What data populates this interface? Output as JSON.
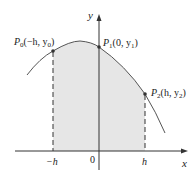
{
  "diagram": {
    "type": "simpsons-rule-parabola",
    "colors": {
      "curve": "#555555",
      "axis": "#333333",
      "shade": "#e6e6e6",
      "point": "#333333",
      "dash": "#333333"
    },
    "axes": {
      "x_label": "x",
      "y_label": "y",
      "origin_label": "0"
    },
    "ticks": {
      "left": "−h",
      "right": "h"
    },
    "points": [
      {
        "id": "P0",
        "name": "P",
        "sub": "0",
        "coords": "(−h, y",
        "coord_sub": "0",
        "close": ")"
      },
      {
        "id": "P1",
        "name": "P",
        "sub": "1",
        "coords": "(0, y",
        "coord_sub": "1",
        "close": ")"
      },
      {
        "id": "P2",
        "name": "P",
        "sub": "2",
        "coords": "(h, y",
        "coord_sub": "2",
        "close": ")"
      }
    ]
  }
}
